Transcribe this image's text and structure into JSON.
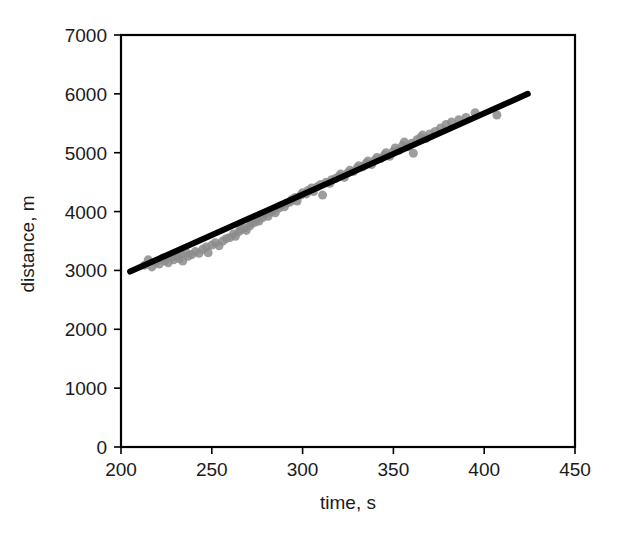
{
  "chart_data": {
    "type": "scatter",
    "title": "",
    "subtitle": "",
    "xlabel": "time, s",
    "ylabel": "distance, m",
    "xlim": [
      200,
      450
    ],
    "ylim": [
      0,
      7000
    ],
    "xticks": [
      200,
      250,
      300,
      350,
      400,
      450
    ],
    "yticks": [
      0,
      1000,
      2000,
      3000,
      4000,
      5000,
      6000,
      7000
    ],
    "xtick_labels": [
      "200",
      "250",
      "300",
      "350",
      "400",
      "450"
    ],
    "ytick_labels": [
      "0",
      "1000",
      "2000",
      "3000",
      "4000",
      "5000",
      "6000",
      "7000"
    ],
    "grid": false,
    "legend": null,
    "legend_position": "none",
    "frame": "box",
    "series": [
      {
        "name": "observations",
        "type": "scatter",
        "marker": "circle",
        "marker_color": "#8c8c8c",
        "marker_size": 9,
        "points": [
          [
            213,
            3090
          ],
          [
            215,
            3180
          ],
          [
            217,
            3060
          ],
          [
            219,
            3140
          ],
          [
            221,
            3110
          ],
          [
            223,
            3210
          ],
          [
            224,
            3160
          ],
          [
            226,
            3130
          ],
          [
            228,
            3230
          ],
          [
            229,
            3180
          ],
          [
            231,
            3250
          ],
          [
            232,
            3200
          ],
          [
            233,
            3280
          ],
          [
            234,
            3160
          ],
          [
            236,
            3300
          ],
          [
            237,
            3240
          ],
          [
            239,
            3270
          ],
          [
            241,
            3320
          ],
          [
            243,
            3290
          ],
          [
            245,
            3360
          ],
          [
            247,
            3400
          ],
          [
            248,
            3300
          ],
          [
            250,
            3430
          ],
          [
            252,
            3470
          ],
          [
            254,
            3420
          ],
          [
            256,
            3500
          ],
          [
            258,
            3540
          ],
          [
            260,
            3560
          ],
          [
            262,
            3620
          ],
          [
            263,
            3580
          ],
          [
            265,
            3660
          ],
          [
            266,
            3700
          ],
          [
            268,
            3720
          ],
          [
            269,
            3680
          ],
          [
            271,
            3760
          ],
          [
            272,
            3800
          ],
          [
            274,
            3820
          ],
          [
            275,
            3880
          ],
          [
            276,
            3840
          ],
          [
            278,
            3900
          ],
          [
            279,
            3960
          ],
          [
            281,
            3920
          ],
          [
            282,
            3990
          ],
          [
            284,
            4020
          ],
          [
            285,
            3980
          ],
          [
            287,
            4060
          ],
          [
            288,
            4100
          ],
          [
            290,
            4080
          ],
          [
            291,
            4140
          ],
          [
            293,
            4160
          ],
          [
            294,
            4200
          ],
          [
            296,
            4240
          ],
          [
            297,
            4180
          ],
          [
            299,
            4280
          ],
          [
            300,
            4320
          ],
          [
            302,
            4300
          ],
          [
            303,
            4360
          ],
          [
            305,
            4400
          ],
          [
            306,
            4340
          ],
          [
            308,
            4420
          ],
          [
            310,
            4460
          ],
          [
            311,
            4280
          ],
          [
            313,
            4500
          ],
          [
            315,
            4480
          ],
          [
            316,
            4540
          ],
          [
            318,
            4560
          ],
          [
            320,
            4600
          ],
          [
            321,
            4640
          ],
          [
            323,
            4580
          ],
          [
            325,
            4660
          ],
          [
            326,
            4700
          ],
          [
            328,
            4680
          ],
          [
            330,
            4740
          ],
          [
            331,
            4780
          ],
          [
            333,
            4760
          ],
          [
            335,
            4820
          ],
          [
            336,
            4860
          ],
          [
            338,
            4800
          ],
          [
            340,
            4880
          ],
          [
            341,
            4920
          ],
          [
            343,
            4900
          ],
          [
            345,
            4960
          ],
          [
            346,
            5000
          ],
          [
            348,
            4940
          ],
          [
            350,
            5020
          ],
          [
            351,
            5080
          ],
          [
            353,
            5040
          ],
          [
            355,
            5120
          ],
          [
            356,
            5180
          ],
          [
            358,
            5100
          ],
          [
            360,
            5160
          ],
          [
            361,
            4990
          ],
          [
            363,
            5220
          ],
          [
            365,
            5260
          ],
          [
            366,
            5300
          ],
          [
            368,
            5240
          ],
          [
            370,
            5320
          ],
          [
            373,
            5360
          ],
          [
            376,
            5420
          ],
          [
            379,
            5480
          ],
          [
            382,
            5520
          ],
          [
            386,
            5560
          ],
          [
            390,
            5600
          ],
          [
            395,
            5680
          ],
          [
            407,
            5640
          ]
        ]
      },
      {
        "name": "linear fit",
        "type": "line",
        "line_color": "#000000",
        "line_width": 6,
        "endpoints": [
          [
            205,
            2980
          ],
          [
            424,
            6000
          ]
        ],
        "slope": 13.79,
        "intercept": 153.0
      }
    ]
  },
  "axes": {
    "x_axis_name": "time-axis",
    "y_axis_name": "distance-axis"
  }
}
